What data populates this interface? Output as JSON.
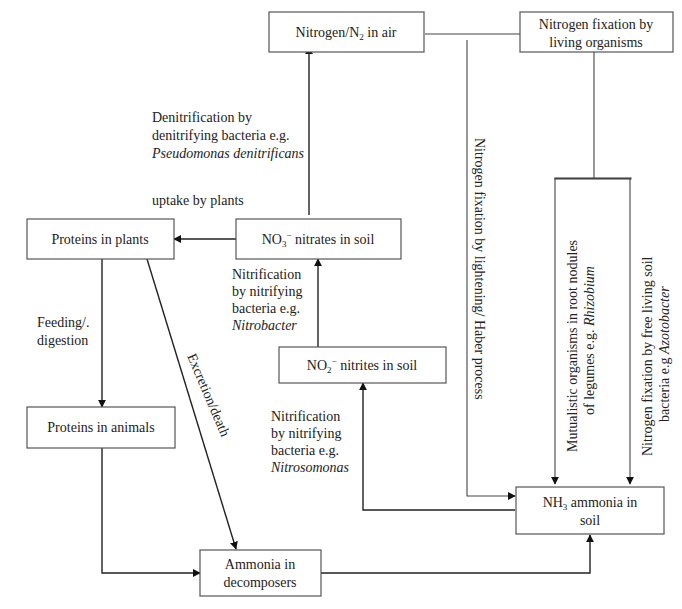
{
  "nodes": {
    "n2_air": {
      "label_pre": "Nitrogen/N",
      "label_sub": "2",
      "label_post": " in air"
    },
    "fixation_living": {
      "line1": "Nitrogen fixation by",
      "line2": "living organisms"
    },
    "proteins_plants": {
      "label": "Proteins in plants"
    },
    "nitrates": {
      "label_pre": "NO",
      "label_sub": "3",
      "label_sup": "−",
      "label_post": " nitrates in soil"
    },
    "nitrites": {
      "label_pre": "NO",
      "label_sub": "2",
      "label_sup": "−",
      "label_post": " nitrites in soil"
    },
    "proteins_animals": {
      "label": "Proteins in animals"
    },
    "ammonia_soil": {
      "line1_pre": "NH",
      "line1_sub": "3",
      "line1_post": " ammonia in",
      "line2": "soil"
    },
    "ammonia_decomposers": {
      "line1": "Ammonia in",
      "line2": "decomposers"
    }
  },
  "edge_labels": {
    "denitrification": {
      "line1": "Denitrification by",
      "line2": "denitrifying bacteria e.g.",
      "line3_italic": "Pseudomonas denitrificans"
    },
    "uptake": {
      "label": "uptake by plants"
    },
    "nitrification_nitrobacter": {
      "line1": "Nitrification",
      "line2": "by nitrifying",
      "line3": "bacteria e.g.",
      "line4_italic": "Nitrobacter"
    },
    "nitrification_nitrosomonas": {
      "line1": "Nitrification",
      "line2": "by nitrifying",
      "line3": "bacteria e.g.",
      "line4_italic": "Nitrosomonas"
    },
    "feeding": {
      "line1": "Feeding/.",
      "line2": "digestion"
    },
    "excretion": {
      "label": "Excretion/death"
    },
    "lightning": {
      "label": "Nitrogen fixation by lightening/ Haber process"
    },
    "mutualistic": {
      "line1": "Mutualistic organisms in root nodules",
      "line2_pre": "of legumes e.g. ",
      "line2_italic": "Rhizobium"
    },
    "free_living": {
      "line1": "Nitrogen fixation by free living soil",
      "line2_pre": "bacteria e.g ",
      "line2_italic": "Azotobacter"
    }
  }
}
